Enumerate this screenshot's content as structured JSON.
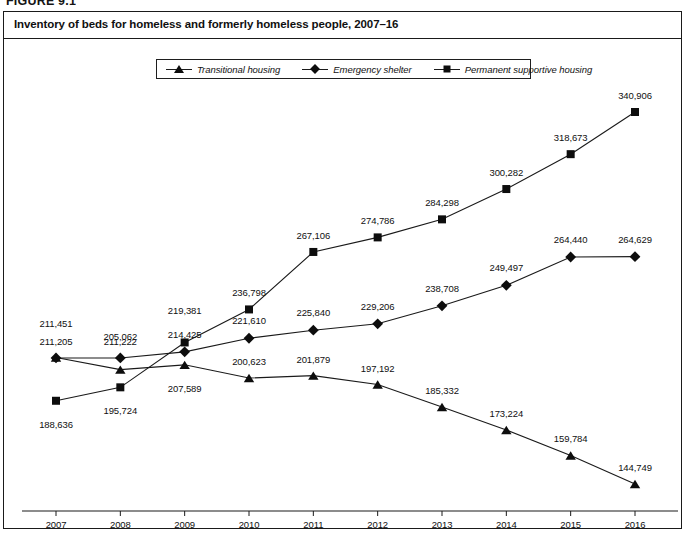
{
  "figure": {
    "caption": "FIGURE 9.1",
    "title": "Inventory of beds for homeless and formerly homeless people, 2007–16"
  },
  "legend": {
    "entries": [
      {
        "label": "Transitional housing",
        "marker": "triangle-marker"
      },
      {
        "label": "Emergency shelter",
        "marker": "diamond-marker"
      },
      {
        "label": "Permanent supportive housing",
        "marker": "square-marker"
      }
    ]
  },
  "chart_data": {
    "type": "line",
    "title": "Inventory of beds for homeless and formerly homeless people, 2007–16",
    "xlabel": "",
    "ylabel": "",
    "grid": false,
    "legend_position": "top-center",
    "axis": {
      "x_visible": true,
      "y_visible": false,
      "ylim": [
        130000,
        350000
      ]
    },
    "categories": [
      "2007",
      "2008",
      "2009",
      "2010",
      "2011",
      "2012",
      "2013",
      "2014",
      "2015",
      "2016"
    ],
    "x": [
      2007,
      2008,
      2009,
      2010,
      2011,
      2012,
      2013,
      2014,
      2015,
      2016
    ],
    "series": [
      {
        "name": "Transitional housing",
        "marker": "triangle",
        "values": [
          211451,
          205062,
          207589,
          200623,
          201879,
          197192,
          185332,
          173224,
          159784,
          144749
        ],
        "labels": [
          "211,451",
          "205,062",
          "207,589",
          "200,623",
          "201,879",
          "197,192",
          "185,332",
          "173,224",
          "159,784",
          "144,749"
        ]
      },
      {
        "name": "Emergency shelter",
        "marker": "diamond",
        "values": [
          211205,
          211222,
          214425,
          221610,
          225840,
          229206,
          238708,
          249497,
          264440,
          264629
        ],
        "labels": [
          "211,205",
          "211,222",
          "214,425",
          "221,610",
          "225,840",
          "229,206",
          "238,708",
          "249,497",
          "264,440",
          "264,629"
        ]
      },
      {
        "name": "Permanent supportive housing",
        "marker": "square",
        "values": [
          188636,
          195724,
          219381,
          236798,
          267106,
          274786,
          284298,
          300282,
          318673,
          340906
        ],
        "labels": [
          "188,636",
          "195,724",
          "219,381",
          "236,798",
          "267,106",
          "274,786",
          "284,298",
          "300,282",
          "318,673",
          "340,906"
        ]
      }
    ]
  },
  "colors": {
    "line": "#1a1a1a",
    "marker": "#0d0d0d",
    "text": "#101010",
    "border": "#1a1a1a",
    "background": "#ffffff"
  }
}
